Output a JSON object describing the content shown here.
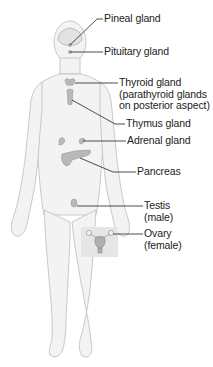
{
  "diagram": {
    "labels": [
      {
        "id": "pineal",
        "text": "Pineal gland"
      },
      {
        "id": "pituitary",
        "text": "Pituitary gland"
      },
      {
        "id": "thyroid",
        "lines": [
          "Thyroid gland",
          "(parathyroid glands",
          "on posterior aspect)"
        ]
      },
      {
        "id": "thymus",
        "text": "Thymus gland"
      },
      {
        "id": "adrenal",
        "text": "Adrenal gland"
      },
      {
        "id": "pancreas",
        "text": "Pancreas"
      },
      {
        "id": "testis",
        "lines": [
          "Testis",
          "(male)"
        ]
      },
      {
        "id": "ovary",
        "lines": [
          "Ovary",
          "(female)"
        ]
      }
    ],
    "colors": {
      "body_fill": "#f4f4f4",
      "body_outline": "#b8b8b8",
      "gland_fill": "#b9b9b9",
      "leader_line": "#222222",
      "inset_bg": "#e6e6e6"
    }
  }
}
